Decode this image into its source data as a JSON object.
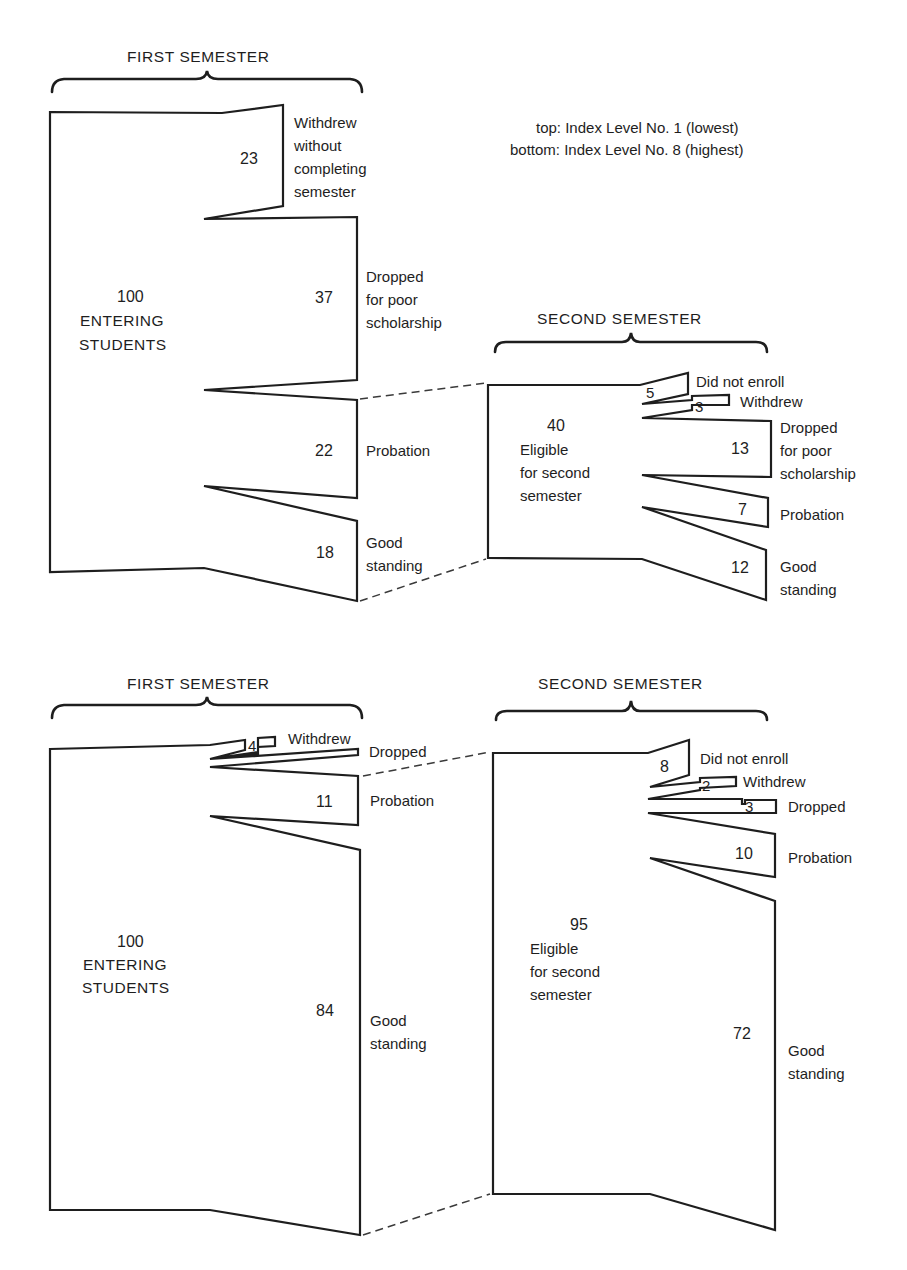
{
  "legend": {
    "line1": "top:  Index Level No. 1 (lowest)",
    "line2": "bottom: Index Level No. 8 (highest)"
  },
  "top": {
    "first_semester": {
      "title": "FIRST SEMESTER",
      "entering": {
        "count": "100",
        "line1": "ENTERING",
        "line2": "STUDENTS"
      },
      "outcomes": [
        {
          "value": "23",
          "label_lines": [
            "Withdrew",
            "without",
            "completing",
            "semester"
          ]
        },
        {
          "value": "37",
          "label_lines": [
            "Dropped",
            "for poor",
            "scholarship"
          ]
        },
        {
          "value": "22",
          "label_lines": [
            "Probation"
          ]
        },
        {
          "value": "18",
          "label_lines": [
            "Good",
            "standing"
          ]
        }
      ]
    },
    "second_semester": {
      "title": "SECOND SEMESTER",
      "eligible": {
        "count": "40",
        "line1": "Eligible",
        "line2": "for second",
        "line3": "semester"
      },
      "outcomes": [
        {
          "value": "5",
          "label_lines": [
            "Did not enroll"
          ]
        },
        {
          "value": "3",
          "label_lines": [
            "Withdrew"
          ]
        },
        {
          "value": "13",
          "label_lines": [
            "Dropped",
            "for poor",
            "scholarship"
          ]
        },
        {
          "value": "7",
          "label_lines": [
            "Probation"
          ]
        },
        {
          "value": "12",
          "label_lines": [
            "Good",
            "standing"
          ]
        }
      ]
    }
  },
  "bottom": {
    "first_semester": {
      "title": "FIRST SEMESTER",
      "entering": {
        "count": "100",
        "line1": "ENTERING",
        "line2": "STUDENTS"
      },
      "outcomes": [
        {
          "value": "4",
          "label_lines": [
            "Withdrew"
          ]
        },
        {
          "value": "",
          "label_lines": [
            "Dropped"
          ]
        },
        {
          "value": "11",
          "label_lines": [
            "Probation"
          ]
        },
        {
          "value": "84",
          "label_lines": [
            "Good",
            "standing"
          ]
        }
      ]
    },
    "second_semester": {
      "title": "SECOND SEMESTER",
      "eligible": {
        "count": "95",
        "line1": "Eligible",
        "line2": "for second",
        "line3": "semester"
      },
      "outcomes": [
        {
          "value": "8",
          "label_lines": [
            "Did not enroll"
          ]
        },
        {
          "value": "2",
          "label_lines": [
            "Withdrew"
          ]
        },
        {
          "value": "3",
          "label_lines": [
            "Dropped"
          ]
        },
        {
          "value": "10",
          "label_lines": [
            "Probation"
          ]
        },
        {
          "value": "72",
          "label_lines": [
            "Good",
            "standing"
          ]
        }
      ]
    }
  }
}
